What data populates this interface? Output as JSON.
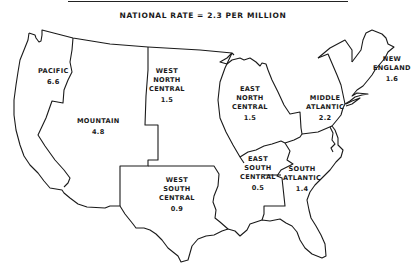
{
  "title": "NATIONAL RATE = 2.3 PER MILLION",
  "map": {
    "type": "choropleth-outline",
    "subject": "United States census divisions",
    "regions": [
      {
        "id": "pacific",
        "name_lines": [
          "PACIFIC"
        ],
        "value": "6.6"
      },
      {
        "id": "mountain",
        "name_lines": [
          "MOUNTAIN"
        ],
        "value": "4.8"
      },
      {
        "id": "west-north-central",
        "name_lines": [
          "WEST",
          "NORTH",
          "CENTRAL"
        ],
        "value": "1.5"
      },
      {
        "id": "west-south-central",
        "name_lines": [
          "WEST",
          "SOUTH",
          "CENTRAL"
        ],
        "value": "0.9"
      },
      {
        "id": "east-north-central",
        "name_lines": [
          "EAST",
          "NORTH",
          "CENTRAL"
        ],
        "value": "1.5"
      },
      {
        "id": "east-south-central",
        "name_lines": [
          "EAST",
          "SOUTH",
          "CENTRAL"
        ],
        "value": "0.5"
      },
      {
        "id": "south-atlantic",
        "name_lines": [
          "SOUTH",
          "ATLANTIC"
        ],
        "value": "1.4"
      },
      {
        "id": "middle-atlantic",
        "name_lines": [
          "MIDDLE",
          "ATLANTIC"
        ],
        "value": "2.2"
      },
      {
        "id": "new-england",
        "name_lines": [
          "NEW",
          "ENGLAND"
        ],
        "value": "1.6"
      }
    ]
  }
}
